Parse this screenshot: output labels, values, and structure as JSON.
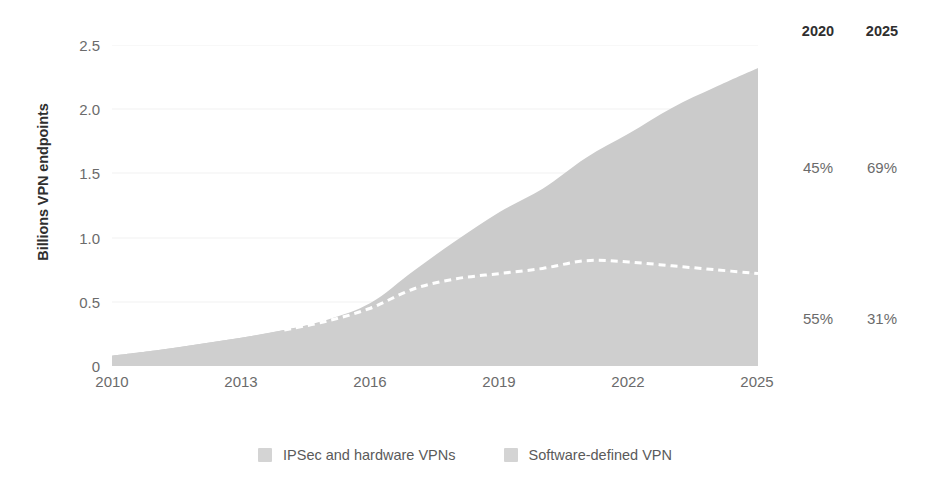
{
  "chart_data": {
    "type": "area",
    "title": "",
    "subtitle": "",
    "xlabel": "",
    "ylabel": "Billions VPN endpoints",
    "xlim": [
      2010,
      2025
    ],
    "ylim": [
      0,
      2.5
    ],
    "grid": true,
    "stacked": true,
    "legend_position": "bottom",
    "x_tick_labels": [
      "2010",
      "2013",
      "2016",
      "2019",
      "2022",
      "2025"
    ],
    "x_ticks": [
      2010,
      2013,
      2016,
      2019,
      2022,
      2025
    ],
    "y_tick_labels": [
      "2.5",
      "2.0",
      "1.5",
      "1.0",
      "0.5",
      "0"
    ],
    "y_ticks": [
      2.5,
      2.0,
      1.5,
      1.0,
      0.5,
      0
    ],
    "x": [
      2010,
      2011,
      2012,
      2013,
      2014,
      2015,
      2016,
      2017,
      2018,
      2019,
      2020,
      2021,
      2022,
      2023,
      2024,
      2025
    ],
    "series": [
      {
        "name": "IPSec and hardware VPNs",
        "color": "#cfcfcf",
        "values": [
          0.08,
          0.12,
          0.17,
          0.22,
          0.28,
          0.35,
          0.45,
          0.6,
          0.68,
          0.72,
          0.76,
          0.82,
          0.81,
          0.78,
          0.75,
          0.72
        ]
      },
      {
        "name": "Software-defined VPN",
        "color": "#cbcbcb",
        "values": [
          0.0,
          0.0,
          0.0,
          0.0,
          0.0,
          0.01,
          0.04,
          0.14,
          0.3,
          0.48,
          0.62,
          0.8,
          1.0,
          1.23,
          1.42,
          1.6
        ]
      }
    ],
    "totals": [
      0.08,
      0.12,
      0.17,
      0.22,
      0.28,
      0.36,
      0.49,
      0.74,
      0.98,
      1.2,
      1.38,
      1.62,
      1.81,
      2.01,
      2.17,
      2.32
    ],
    "divider_line": {
      "style": "dashed",
      "color": "#ffffff",
      "label": "boundary between IPSec/hardware VPNs and Software-defined VPN"
    },
    "share_table": {
      "headers": [
        "2020",
        "2025"
      ],
      "rows": [
        {
          "segment": "Software-defined VPN",
          "values": [
            "45%",
            "69%"
          ]
        },
        {
          "segment": "IPSec and hardware VPNs",
          "values": [
            "55%",
            "31%"
          ]
        }
      ]
    }
  },
  "colors": {
    "area_lower": "#cfcfcf",
    "area_upper": "#cbcbcb",
    "gridline": "#f2f2f2",
    "tick_text": "#6b6b6b",
    "bold_text": "#2f2f2f",
    "divider": "#ffffff",
    "background": "#ffffff"
  },
  "axes": {
    "y_title": "Billions VPN endpoints",
    "y_ticks": [
      "2.5",
      "2.0",
      "1.5",
      "1.0",
      "0.5",
      "0"
    ],
    "x_ticks": [
      "2010",
      "2013",
      "2016",
      "2019",
      "2022",
      "2025"
    ]
  },
  "side_table": {
    "headers": [
      "2020",
      "2025"
    ],
    "top_values": [
      "45%",
      "69%"
    ],
    "bottom_values": [
      "55%",
      "31%"
    ]
  },
  "legend": {
    "items": [
      {
        "label": "IPSec and hardware VPNs",
        "color": "#cfcfcf"
      },
      {
        "label": "Software-defined VPN",
        "color": "#cbcbcb"
      }
    ]
  }
}
